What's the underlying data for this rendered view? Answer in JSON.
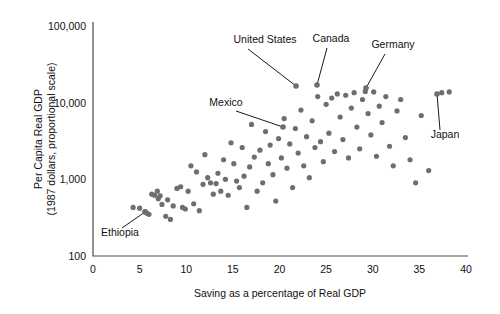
{
  "figure": {
    "background": "#ffffff",
    "point_color": "#6e6e6e",
    "axis_color": "#4d4d4d",
    "text_color": "#111111"
  },
  "chart_data": {
    "type": "scatter",
    "title": "",
    "subtitle": "",
    "xlabel": "Saving as a percentage of Real GDP",
    "ylabel": "Per Capita Real GDP",
    "ylabel_line2": "(1987 dollars, proportional scale)",
    "xlim": [
      0,
      40
    ],
    "ylim": [
      100,
      100000
    ],
    "yscale": "log",
    "xscale": "linear",
    "grid": false,
    "legend": "none",
    "xticks": [
      0,
      5,
      10,
      15,
      20,
      25,
      30,
      35,
      40
    ],
    "xticklabels": [
      "0",
      "5",
      "10",
      "15",
      "20",
      "25",
      "30",
      "35",
      "40"
    ],
    "yticks": [
      100,
      1000,
      10000,
      100000
    ],
    "yticklabels": [
      "100",
      "1,000",
      "10,000",
      "100,000"
    ],
    "series": [
      {
        "name": "Countries",
        "marker": "circle",
        "color": "#6e6e6e",
        "points": [
          [
            4.3,
            430
          ],
          [
            5.0,
            420
          ],
          [
            5.6,
            380
          ],
          [
            5.8,
            360
          ],
          [
            6.0,
            350
          ],
          [
            6.3,
            640
          ],
          [
            6.6,
            620
          ],
          [
            6.9,
            700
          ],
          [
            7.0,
            560
          ],
          [
            7.2,
            610
          ],
          [
            7.4,
            470
          ],
          [
            7.8,
            330
          ],
          [
            8.0,
            540
          ],
          [
            8.3,
            300
          ],
          [
            8.6,
            450
          ],
          [
            9.0,
            760
          ],
          [
            9.4,
            800
          ],
          [
            9.6,
            430
          ],
          [
            9.9,
            410
          ],
          [
            10.2,
            700
          ],
          [
            10.5,
            1500
          ],
          [
            10.8,
            480
          ],
          [
            11.1,
            1250
          ],
          [
            11.4,
            390
          ],
          [
            11.8,
            860
          ],
          [
            12.0,
            2100
          ],
          [
            12.3,
            1050
          ],
          [
            12.6,
            900
          ],
          [
            12.9,
            640
          ],
          [
            13.2,
            880
          ],
          [
            13.4,
            1200
          ],
          [
            13.7,
            700
          ],
          [
            14.0,
            1800
          ],
          [
            14.2,
            1000
          ],
          [
            14.5,
            620
          ],
          [
            14.8,
            3000
          ],
          [
            15.1,
            1600
          ],
          [
            15.4,
            950
          ],
          [
            15.7,
            780
          ],
          [
            16.0,
            2600
          ],
          [
            16.2,
            1100
          ],
          [
            16.5,
            430
          ],
          [
            16.8,
            1450
          ],
          [
            17.0,
            5200
          ],
          [
            17.3,
            1950
          ],
          [
            17.6,
            700
          ],
          [
            17.9,
            2400
          ],
          [
            18.2,
            900
          ],
          [
            18.5,
            4200
          ],
          [
            18.8,
            1600
          ],
          [
            19.0,
            2800
          ],
          [
            19.3,
            1150
          ],
          [
            19.6,
            520
          ],
          [
            19.9,
            3400
          ],
          [
            20.2,
            1900
          ],
          [
            20.5,
            6200
          ],
          [
            20.8,
            1400
          ],
          [
            21.1,
            2900
          ],
          [
            21.4,
            780
          ],
          [
            21.7,
            4600
          ],
          [
            22.0,
            2200
          ],
          [
            22.3,
            8000
          ],
          [
            22.6,
            1500
          ],
          [
            22.9,
            3600
          ],
          [
            23.2,
            1050
          ],
          [
            23.5,
            5800
          ],
          [
            23.8,
            2600
          ],
          [
            24.1,
            12000
          ],
          [
            24.4,
            3100
          ],
          [
            24.7,
            1700
          ],
          [
            25.0,
            9500
          ],
          [
            25.3,
            4000
          ],
          [
            25.6,
            11500
          ],
          [
            25.9,
            2300
          ],
          [
            26.2,
            13000
          ],
          [
            26.5,
            6500
          ],
          [
            26.8,
            3300
          ],
          [
            27.1,
            12500
          ],
          [
            27.4,
            1900
          ],
          [
            27.7,
            8500
          ],
          [
            28.0,
            13500
          ],
          [
            28.3,
            4800
          ],
          [
            28.6,
            2500
          ],
          [
            28.9,
            11000
          ],
          [
            29.2,
            14000
          ],
          [
            29.5,
            7200
          ],
          [
            29.8,
            3800
          ],
          [
            30.1,
            13800
          ],
          [
            30.4,
            2000
          ],
          [
            30.7,
            9000
          ],
          [
            31.0,
            5500
          ],
          [
            31.4,
            12000
          ],
          [
            31.8,
            2700
          ],
          [
            32.2,
            1500
          ],
          [
            32.6,
            7800
          ],
          [
            33.0,
            11000
          ],
          [
            33.5,
            3500
          ],
          [
            34.0,
            1800
          ],
          [
            34.6,
            900
          ],
          [
            35.2,
            6800
          ],
          [
            36.0,
            1300
          ],
          [
            37.4,
            13500
          ],
          [
            38.2,
            13800
          ]
        ]
      }
    ],
    "annotations": [
      {
        "label": "United States",
        "label_x": 265,
        "label_y": 43,
        "leader": [
          [
            248,
            49
          ],
          [
            296,
            86
          ]
        ],
        "target": [
          296,
          86
        ]
      },
      {
        "label": "Canada",
        "label_x": 331,
        "label_y": 42,
        "leader": [
          [
            327,
            48
          ],
          [
            317,
            85
          ]
        ],
        "target": [
          317,
          85
        ]
      },
      {
        "label": "Germany",
        "label_x": 393,
        "label_y": 48,
        "leader": [
          [
            385,
            54
          ],
          [
            366,
            88
          ]
        ],
        "target": [
          366,
          88
        ]
      },
      {
        "label": "Japan",
        "label_x": 445,
        "label_y": 138,
        "leader": [
          [
            440,
            130
          ],
          [
            437,
            94
          ]
        ],
        "target": [
          437,
          94
        ]
      },
      {
        "label": "Mexico",
        "label_x": 226,
        "label_y": 106,
        "leader": [
          [
            236,
            111
          ],
          [
            283,
            127
          ]
        ],
        "target": [
          283,
          127
        ]
      },
      {
        "label": "Ethiopia",
        "label_x": 120,
        "label_y": 236,
        "leader": [
          [
            122,
            228
          ],
          [
            145,
            212
          ]
        ],
        "target": [
          145,
          212
        ]
      }
    ]
  }
}
